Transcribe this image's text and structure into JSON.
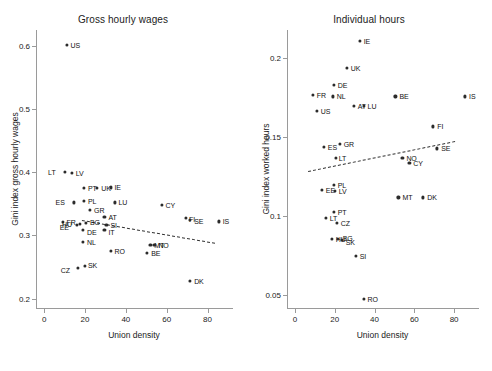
{
  "figure": {
    "xlabel": "Union density",
    "xticks": [
      "0",
      "20",
      "40",
      "60",
      "80"
    ]
  },
  "panels": [
    {
      "id": "gross-hourly-wages",
      "title": "Gross hourly wages",
      "ylabel": "Gini index gross hourly wages",
      "yticks": [
        "0.2",
        "0.3",
        "0.4",
        "0.5",
        "0.6"
      ]
    },
    {
      "id": "individual-hours",
      "title": "Individual hours",
      "ylabel": "Gini index worked hours",
      "yticks": [
        "0.05",
        "0.1",
        "0.15",
        "0.2"
      ]
    }
  ],
  "chart_data": [
    {
      "type": "scatter",
      "title": "Gross hourly wages",
      "xlabel": "Union density",
      "ylabel": "Gini index gross hourly wages",
      "xlim": [
        -4,
        92
      ],
      "ylim": [
        0.185,
        0.625
      ],
      "xticks": [
        0,
        20,
        40,
        60,
        80
      ],
      "yticks": [
        0.2,
        0.3,
        0.4,
        0.5,
        0.6
      ],
      "grid": false,
      "legend": null,
      "point_labels": true,
      "trendline": {
        "style": "dashed",
        "x": [
          18,
          83
        ],
        "y": [
          0.324,
          0.288
        ]
      },
      "points": [
        {
          "label": "US",
          "x": 10.5,
          "y": 0.601
        },
        {
          "label": "LT",
          "x": 9.5,
          "y": 0.4
        },
        {
          "label": "LV",
          "x": 13.0,
          "y": 0.399
        },
        {
          "label": "PT",
          "x": 19.0,
          "y": 0.375
        },
        {
          "label": "UK",
          "x": 25.5,
          "y": 0.375
        },
        {
          "label": "IE",
          "x": 32.0,
          "y": 0.376
        },
        {
          "label": "ES",
          "x": 14.0,
          "y": 0.352
        },
        {
          "label": "PL",
          "x": 19.0,
          "y": 0.355
        },
        {
          "label": "LU",
          "x": 34.0,
          "y": 0.352
        },
        {
          "label": "GR",
          "x": 22.0,
          "y": 0.34
        },
        {
          "label": "CY",
          "x": 57.0,
          "y": 0.348
        },
        {
          "label": "AT",
          "x": 29.0,
          "y": 0.329
        },
        {
          "label": "FR",
          "x": 8.5,
          "y": 0.321
        },
        {
          "label": "EE",
          "x": 15.5,
          "y": 0.316
        },
        {
          "label": "HU",
          "x": 17.0,
          "y": 0.318
        },
        {
          "label": "BG",
          "x": 20.0,
          "y": 0.32
        },
        {
          "label": "SI",
          "x": 30.0,
          "y": 0.316
        },
        {
          "label": "DE",
          "x": 18.5,
          "y": 0.308
        },
        {
          "label": "IT",
          "x": 29.0,
          "y": 0.308
        },
        {
          "label": "FI",
          "x": 69.0,
          "y": 0.327
        },
        {
          "label": "SE",
          "x": 71.0,
          "y": 0.325
        },
        {
          "label": "IS",
          "x": 85.0,
          "y": 0.322
        },
        {
          "label": "NL",
          "x": 18.5,
          "y": 0.29
        },
        {
          "label": "MT",
          "x": 51.5,
          "y": 0.285
        },
        {
          "label": "NO",
          "x": 53.5,
          "y": 0.285
        },
        {
          "label": "RO",
          "x": 32.0,
          "y": 0.275
        },
        {
          "label": "BE",
          "x": 50.0,
          "y": 0.272
        },
        {
          "label": "CZ",
          "x": 16.0,
          "y": 0.249
        },
        {
          "label": "SK",
          "x": 19.5,
          "y": 0.251
        },
        {
          "label": "DK",
          "x": 71.0,
          "y": 0.228
        }
      ]
    },
    {
      "type": "scatter",
      "title": "Individual hours",
      "xlabel": "Union density",
      "ylabel": "Gini index worked hours",
      "xlim": [
        -4,
        92
      ],
      "ylim": [
        0.042,
        0.218
      ],
      "xticks": [
        0,
        20,
        40,
        60,
        80
      ],
      "yticks": [
        0.05,
        0.1,
        0.15,
        0.2
      ],
      "grid": false,
      "legend": null,
      "point_labels": true,
      "trendline": {
        "style": "dashed",
        "x": [
          6,
          80
        ],
        "y": [
          0.129,
          0.148
        ]
      },
      "points": [
        {
          "label": "IE",
          "x": 32.0,
          "y": 0.211
        },
        {
          "label": "UK",
          "x": 25.5,
          "y": 0.194
        },
        {
          "label": "DE",
          "x": 19.0,
          "y": 0.183
        },
        {
          "label": "FR",
          "x": 8.5,
          "y": 0.177
        },
        {
          "label": "NL",
          "x": 18.5,
          "y": 0.176
        },
        {
          "label": "BE",
          "x": 50.0,
          "y": 0.176
        },
        {
          "label": "IS",
          "x": 85.0,
          "y": 0.176
        },
        {
          "label": "AT",
          "x": 29.0,
          "y": 0.17
        },
        {
          "label": "LU",
          "x": 34.0,
          "y": 0.17
        },
        {
          "label": "US",
          "x": 10.5,
          "y": 0.167
        },
        {
          "label": "FI",
          "x": 69.0,
          "y": 0.157
        },
        {
          "label": "GR",
          "x": 22.0,
          "y": 0.146
        },
        {
          "label": "ES",
          "x": 14.0,
          "y": 0.144
        },
        {
          "label": "SE",
          "x": 71.0,
          "y": 0.143
        },
        {
          "label": "LT",
          "x": 20.0,
          "y": 0.137
        },
        {
          "label": "NO",
          "x": 53.5,
          "y": 0.137
        },
        {
          "label": "CY",
          "x": 57.0,
          "y": 0.134
        },
        {
          "label": "PL",
          "x": 19.0,
          "y": 0.12
        },
        {
          "label": "EE",
          "x": 13.0,
          "y": 0.117
        },
        {
          "label": "LV",
          "x": 19.5,
          "y": 0.116
        },
        {
          "label": "MT",
          "x": 51.5,
          "y": 0.112
        },
        {
          "label": "DK",
          "x": 64.0,
          "y": 0.112
        },
        {
          "label": "PT",
          "x": 19.0,
          "y": 0.103
        },
        {
          "label": "LT2",
          "x": 15.0,
          "y": 0.099
        },
        {
          "label": "CZ",
          "x": 20.5,
          "y": 0.096
        },
        {
          "label": "HU",
          "x": 18.0,
          "y": 0.086
        },
        {
          "label": "BG",
          "x": 21.0,
          "y": 0.086
        },
        {
          "label": "SK",
          "x": 23.0,
          "y": 0.085
        },
        {
          "label": "SI",
          "x": 30.0,
          "y": 0.075
        },
        {
          "label": "RO",
          "x": 34.0,
          "y": 0.048
        }
      ]
    }
  ]
}
